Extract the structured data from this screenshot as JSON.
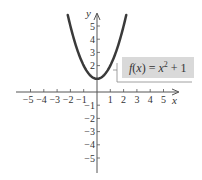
{
  "chart_data": {
    "type": "line",
    "title": "",
    "function_label": "f(x) = x² + 1",
    "function_parts": {
      "lhs": "f(x) = x",
      "exponent": "2",
      "rhs": " + 1"
    },
    "xlabel": "x",
    "ylabel": "y",
    "xlim": [
      -5.5,
      5.5
    ],
    "ylim": [
      -6,
      6
    ],
    "x_ticks": [
      -5,
      -4,
      -3,
      -2,
      -1,
      1,
      2,
      3,
      4,
      5
    ],
    "y_ticks": [
      -5,
      -4,
      -3,
      -2,
      -1,
      2,
      3,
      4,
      5
    ],
    "x_tick_labels": [
      "−5",
      "−4",
      "−3",
      "−2",
      "−1",
      "1",
      "2",
      "3",
      "4",
      "5"
    ],
    "y_tick_labels": [
      "5",
      "4",
      "3",
      "2",
      "−1",
      "−2",
      "−3",
      "−4",
      "−5"
    ],
    "series": [
      {
        "name": "f(x) = x^2 + 1",
        "x": [
          -2.2,
          -2.0,
          -1.5,
          -1.0,
          -0.5,
          0,
          0.5,
          1.0,
          1.5,
          2.0,
          2.2
        ],
        "y": [
          5.84,
          5.0,
          3.25,
          2.0,
          1.25,
          1.0,
          1.25,
          2.0,
          3.25,
          5.0,
          5.84
        ]
      }
    ],
    "grid": false,
    "legend": "none"
  },
  "colors": {
    "curve": "#3a3a3a",
    "axis": "#555555",
    "label_box": "#d9d9d9"
  }
}
